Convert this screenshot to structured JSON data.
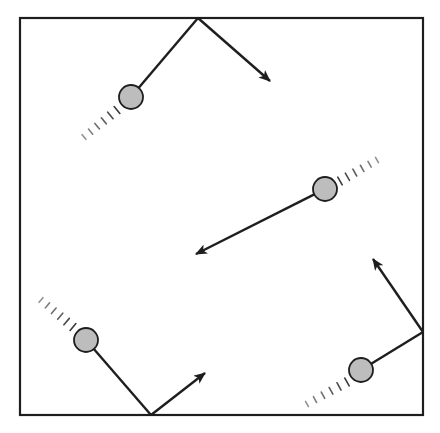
{
  "diagram": {
    "colors": {
      "background": "#ffffff",
      "stroke": "#1e1e1e",
      "ball_fill": "#bdbdbd",
      "trail": "#3a3a3a"
    },
    "box": {
      "x1": 20,
      "y1": 18,
      "x2": 423,
      "y2": 415
    },
    "ball_radius": 12,
    "balls": [
      {
        "id": "ball-1",
        "center": [
          131,
          97
        ],
        "bounce_point": [
          198,
          18
        ],
        "wall": "top",
        "arrow_tip": [
          270,
          81
        ],
        "trail_from": [
          117,
          110
        ],
        "trail_to": [
          84,
          137
        ]
      },
      {
        "id": "ball-2",
        "center": [
          325,
          189
        ],
        "bounce_point": null,
        "wall": null,
        "arrow_tip": [
          196,
          254
        ],
        "trail_from": [
          340,
          181
        ],
        "trail_to": [
          377,
          160
        ]
      },
      {
        "id": "ball-3",
        "center": [
          86,
          340
        ],
        "bounce_point": [
          151,
          415
        ],
        "wall": "bottom",
        "arrow_tip": [
          205,
          373
        ],
        "trail_from": [
          73,
          327
        ],
        "trail_to": [
          41,
          300
        ]
      },
      {
        "id": "ball-4",
        "center": [
          361,
          370
        ],
        "bounce_point": [
          423,
          332
        ],
        "wall": "right",
        "arrow_tip": [
          373,
          259
        ],
        "trail_from": [
          347,
          382
        ],
        "trail_to": [
          307,
          404
        ]
      }
    ]
  }
}
